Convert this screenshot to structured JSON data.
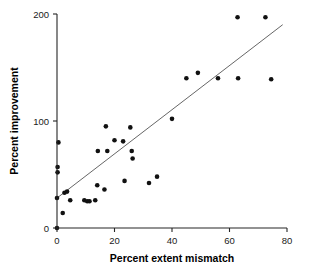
{
  "chart_data": {
    "type": "scatter",
    "title": "",
    "xlabel": "Percent extent mismatch",
    "ylabel": "Percent improvement",
    "xlim": [
      0,
      80
    ],
    "ylim": [
      0,
      200
    ],
    "xticks": [
      0,
      20,
      40,
      60,
      80
    ],
    "yticks": [
      0,
      100,
      200
    ],
    "xtick_labels": [
      "0",
      "20",
      "40",
      "60",
      "80"
    ],
    "ytick_labels": [
      "0",
      "100",
      "200"
    ],
    "grid": false,
    "legend": null,
    "marker": {
      "shape": "circle",
      "color": "#111111",
      "size": 4.6
    },
    "points": [
      {
        "x": 0.0,
        "y": 0
      },
      {
        "x": 0.0,
        "y": 28
      },
      {
        "x": 0.2,
        "y": 52
      },
      {
        "x": 0.2,
        "y": 57
      },
      {
        "x": 0.5,
        "y": 80
      },
      {
        "x": 2.0,
        "y": 14
      },
      {
        "x": 2.6,
        "y": 33
      },
      {
        "x": 3.5,
        "y": 34
      },
      {
        "x": 4.6,
        "y": 26
      },
      {
        "x": 9.5,
        "y": 26
      },
      {
        "x": 10.5,
        "y": 25
      },
      {
        "x": 11.3,
        "y": 25
      },
      {
        "x": 13.3,
        "y": 26
      },
      {
        "x": 14.0,
        "y": 40
      },
      {
        "x": 14.2,
        "y": 72
      },
      {
        "x": 16.5,
        "y": 36
      },
      {
        "x": 17.0,
        "y": 95
      },
      {
        "x": 17.5,
        "y": 72
      },
      {
        "x": 20.0,
        "y": 82
      },
      {
        "x": 23.0,
        "y": 81
      },
      {
        "x": 23.5,
        "y": 44
      },
      {
        "x": 25.5,
        "y": 94
      },
      {
        "x": 26.0,
        "y": 72
      },
      {
        "x": 26.3,
        "y": 65
      },
      {
        "x": 32.0,
        "y": 42
      },
      {
        "x": 34.8,
        "y": 48
      },
      {
        "x": 40.0,
        "y": 102
      },
      {
        "x": 45.0,
        "y": 140
      },
      {
        "x": 49.0,
        "y": 145
      },
      {
        "x": 56.0,
        "y": 140
      },
      {
        "x": 62.8,
        "y": 197
      },
      {
        "x": 63.0,
        "y": 140
      },
      {
        "x": 72.5,
        "y": 197
      },
      {
        "x": 74.5,
        "y": 139
      }
    ],
    "trendline": {
      "visible": true,
      "color": "#555555",
      "x_start": 0.0,
      "y_start": 28,
      "x_end": 78.5,
      "y_end": 190
    }
  }
}
